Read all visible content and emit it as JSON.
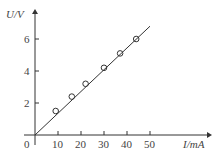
{
  "chart_data": {
    "type": "scatter",
    "title": "",
    "xlabel": "I/mA",
    "ylabel": "U/V",
    "x_ticks": [
      0,
      10,
      20,
      30,
      40,
      50
    ],
    "y_ticks": [
      2,
      4,
      6
    ],
    "xlim": [
      0,
      55
    ],
    "ylim": [
      0,
      7
    ],
    "series": [
      {
        "name": "measurements",
        "x": [
          9,
          16,
          22,
          30,
          37,
          44
        ],
        "y": [
          1.5,
          2.4,
          3.2,
          4.2,
          5.1,
          6.0
        ]
      }
    ],
    "fit_line": {
      "from": [
        0,
        0
      ],
      "to": [
        50,
        6.8
      ]
    },
    "grid": false
  },
  "labels": {
    "x_axis": "I/mA",
    "y_axis": "U/V",
    "origin": "0"
  }
}
